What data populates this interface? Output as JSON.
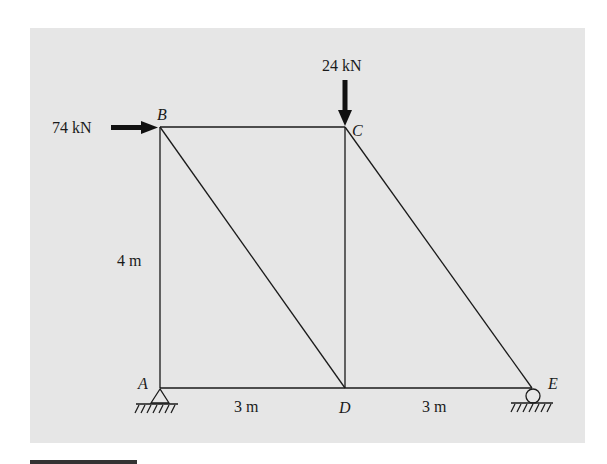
{
  "figure": {
    "type": "truss",
    "background": "#e6e6e6",
    "nodes": {
      "A": {
        "label": "A",
        "x": 160,
        "y": 388
      },
      "B": {
        "label": "B",
        "x": 160,
        "y": 127
      },
      "C": {
        "label": "C",
        "x": 345,
        "y": 127
      },
      "D": {
        "label": "D",
        "x": 345,
        "y": 388
      },
      "E": {
        "label": "E",
        "x": 532,
        "y": 388
      }
    },
    "members": [
      "AB",
      "BC",
      "AD",
      "DE",
      "BD",
      "CD",
      "CE"
    ],
    "loads": [
      {
        "node": "B",
        "label": "74 kN",
        "direction": "right"
      },
      {
        "node": "C",
        "label": "24 kN",
        "direction": "down"
      }
    ],
    "dimensions": [
      {
        "label": "4 m",
        "span": "AB"
      },
      {
        "label": "3 m",
        "span": "AD"
      },
      {
        "label": "3 m",
        "span": "DE"
      }
    ],
    "supports": [
      {
        "node": "A",
        "type": "pin"
      },
      {
        "node": "E",
        "type": "roller"
      }
    ]
  }
}
